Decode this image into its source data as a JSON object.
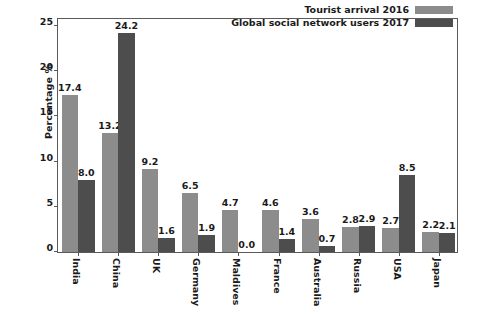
{
  "chart_data": {
    "type": "bar",
    "title": "",
    "xlabel": "",
    "ylabel": "Percentage %",
    "ylim": [
      0,
      26
    ],
    "yticks": [
      0,
      5,
      10,
      15,
      20,
      25
    ],
    "ytick_labels": [
      "0",
      "5",
      "10",
      "15",
      "20",
      "25"
    ],
    "grid": false,
    "legend_position": "top-right",
    "bar_label_format": "one-decimal",
    "categories": [
      "India",
      "China",
      "UK",
      "Germany",
      "Maldives",
      "France",
      "Australia",
      "Russia",
      "USA",
      "Japan"
    ],
    "series": [
      {
        "name": "Tourist arrival 2016",
        "color": "#8c8c8c",
        "values": [
          17.4,
          13.2,
          9.2,
          6.5,
          4.7,
          4.6,
          3.6,
          2.8,
          2.7,
          2.2
        ],
        "labels": [
          "17.4",
          "13.2",
          "9.2",
          "6.5",
          "4.7",
          "4.6",
          "3.6",
          "2.8",
          "2.7",
          "2.2"
        ]
      },
      {
        "name": "Global social network users 2017",
        "color": "#4d4d4d",
        "values": [
          8.0,
          24.2,
          1.6,
          1.9,
          0.0,
          1.4,
          0.7,
          2.9,
          8.5,
          2.1
        ],
        "labels": [
          "8.0",
          "24.2",
          "1.6",
          "1.9",
          "0.0",
          "1.4",
          "0.7",
          "2.9",
          "8.5",
          "2.1"
        ]
      }
    ]
  },
  "legend": {
    "entries": [
      {
        "label": "Tourist arrival 2016",
        "color": "#8c8c8c"
      },
      {
        "label": "Global social network users 2017",
        "color": "#4d4d4d"
      }
    ]
  },
  "axes": {
    "y_label": "Percentage %"
  }
}
